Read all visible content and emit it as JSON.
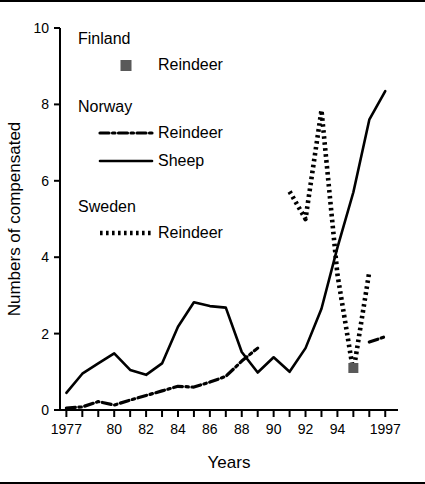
{
  "figure": {
    "top_rule": true,
    "bottom_rule": true,
    "background": "#ffffff",
    "ink": "#000000"
  },
  "legend": {
    "position": "upper-left-inside",
    "groups": [
      {
        "country": "Finland",
        "entries": [
          {
            "label": "Reindeer",
            "style": "square-marker",
            "color": "#595959"
          }
        ]
      },
      {
        "country": "Norway",
        "entries": [
          {
            "label": "Reindeer",
            "style": "dash-dot",
            "color": "#000000"
          },
          {
            "label": "Sheep",
            "style": "solid",
            "color": "#000000"
          }
        ]
      },
      {
        "country": "Sweden",
        "entries": [
          {
            "label": "Reindeer",
            "style": "dotted",
            "color": "#000000"
          }
        ]
      }
    ]
  },
  "chart_data": {
    "type": "line",
    "title": "",
    "xlabel": "Years",
    "ylabel": "Numbers of compensated",
    "xlim": [
      1976.6,
      1997.8
    ],
    "ylim": [
      0,
      10
    ],
    "grid": false,
    "x_ticks": [
      1977,
      1978,
      1979,
      1980,
      1981,
      1982,
      1983,
      1984,
      1985,
      1986,
      1987,
      1988,
      1989,
      1990,
      1991,
      1992,
      1993,
      1994,
      1995,
      1996,
      1997
    ],
    "x_tick_labels": [
      "1977",
      "",
      "",
      "80",
      "",
      "82",
      "",
      "84",
      "",
      "86",
      "",
      "88",
      "",
      "90",
      "",
      "92",
      "",
      "94",
      "",
      "",
      "1997"
    ],
    "y_ticks": [
      0,
      2,
      4,
      6,
      8,
      10
    ],
    "y_tick_labels": [
      "0",
      "2",
      "4",
      "6",
      "8",
      "10"
    ],
    "series": [
      {
        "name": "Norway Sheep",
        "style": "solid",
        "color": "#000000",
        "x": [
          1977,
          1978,
          1979,
          1980,
          1981,
          1982,
          1983,
          1984,
          1985,
          1986,
          1987,
          1988,
          1989,
          1990,
          1991,
          1992,
          1993,
          1994,
          1995,
          1996,
          1997
        ],
        "values": [
          0.45,
          0.95,
          1.22,
          1.48,
          1.05,
          0.92,
          1.22,
          2.18,
          2.82,
          2.72,
          2.68,
          1.52,
          0.98,
          1.38,
          1.0,
          1.62,
          2.65,
          4.25,
          5.7,
          7.6,
          8.35
        ]
      },
      {
        "name": "Norway Reindeer",
        "style": "dash-dot",
        "color": "#000000",
        "segments": [
          {
            "x": [
              1977,
              1978,
              1979,
              1980,
              1981,
              1982,
              1983,
              1984,
              1985,
              1986,
              1987,
              1988,
              1989
            ],
            "values": [
              0.05,
              0.08,
              0.22,
              0.13,
              0.26,
              0.38,
              0.5,
              0.62,
              0.6,
              0.73,
              0.88,
              1.28,
              1.62
            ]
          },
          {
            "x": [
              1996,
              1997
            ],
            "values": [
              1.78,
              1.92
            ]
          }
        ]
      },
      {
        "name": "Sweden Reindeer",
        "style": "dotted",
        "color": "#000000",
        "segments": [
          {
            "x": [
              1991,
              1992,
              1993,
              1994,
              1995
            ],
            "values": [
              5.72,
              5.0,
              7.85,
              3.55,
              1.0
            ]
          },
          {
            "x": [
              1995,
              1996
            ],
            "values": [
              1.0,
              3.62
            ]
          }
        ]
      },
      {
        "name": "Finland Reindeer",
        "style": "square-marker",
        "color": "#595959",
        "x": [
          1995
        ],
        "values": [
          1.1
        ]
      }
    ]
  }
}
